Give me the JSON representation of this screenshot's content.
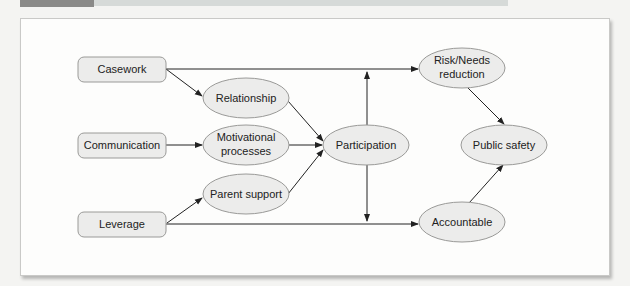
{
  "diagram": {
    "type": "flow",
    "colors": {
      "node_fill": "#ececeb",
      "node_stroke": "#9a9a98",
      "edge": "#222222",
      "frame_bg": "#fdfdfc"
    },
    "nodes": {
      "casework": {
        "label": "Casework",
        "shape": "rounded-rect"
      },
      "communication": {
        "label": "Communication",
        "shape": "rounded-rect"
      },
      "leverage": {
        "label": "Leverage",
        "shape": "rounded-rect"
      },
      "relationship": {
        "label": "Relationship",
        "shape": "ellipse"
      },
      "motivational": {
        "label_line1": "Motivational",
        "label_line2": "processes",
        "shape": "ellipse"
      },
      "parent_support": {
        "label": "Parent support",
        "shape": "ellipse"
      },
      "participation": {
        "label": "Participation",
        "shape": "ellipse"
      },
      "risk_needs": {
        "label_line1": "Risk/Needs",
        "label_line2": "reduction",
        "shape": "ellipse"
      },
      "public_safety": {
        "label": "Public safety",
        "shape": "ellipse"
      },
      "accountable": {
        "label": "Accountable",
        "shape": "ellipse"
      }
    },
    "edges": [
      {
        "from": "Casework",
        "to": "Risk/Needs reduction"
      },
      {
        "from": "Casework",
        "to": "Relationship"
      },
      {
        "from": "Communication",
        "to": "Motivational processes"
      },
      {
        "from": "Leverage",
        "to": "Parent support"
      },
      {
        "from": "Leverage",
        "to": "Accountable"
      },
      {
        "from": "Relationship",
        "to": "Participation"
      },
      {
        "from": "Motivational processes",
        "to": "Participation"
      },
      {
        "from": "Parent support",
        "to": "Participation"
      },
      {
        "from": "Participation",
        "to": "Risk/Needs reduction"
      },
      {
        "from": "Participation",
        "to": "Accountable"
      },
      {
        "from": "Risk/Needs reduction",
        "to": "Public safety"
      },
      {
        "from": "Accountable",
        "to": "Public safety"
      }
    ]
  }
}
